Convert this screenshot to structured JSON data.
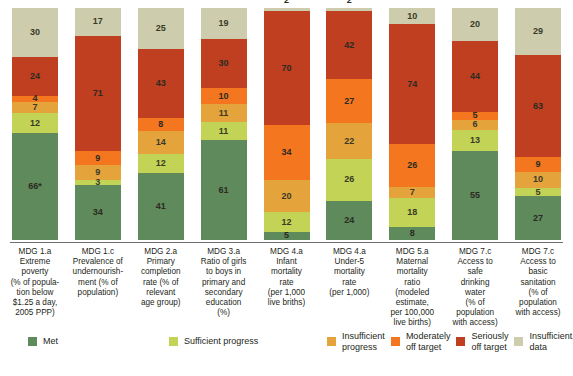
{
  "chart_data": {
    "type": "bar",
    "subtype": "stacked-100-percent",
    "title": "",
    "xlabel": "",
    "ylabel": "",
    "grid": false,
    "legend_position": "bottom",
    "categories": [
      "MDG 1.a Extreme poverty (% of population below $1.25 a day, 2005 PPP)",
      "MDG 1.c Prevalence of undernourishment (% of population)",
      "MDG 2.a Primary completion rate (% of relevant age group)",
      "MDG 3.a Ratio of girls to boys in primary and secondary education (%)",
      "MDG 4.a Infant mortality rate (per 1,000 live briths)",
      "MDG 4.a Under-5 mortality rate (per 1,000)",
      "MDG 5.a Maternal mortality ratio (modeled estimate, per 100,000 live births)",
      "MDG 7.c Access to safe drinking water (% of population with access)",
      "MDG 7.c Access to basic sanitation (% of population with access)"
    ],
    "series": [
      {
        "name": "Met",
        "color": "#5f8a5c",
        "values": [
          66,
          34,
          41,
          61,
          5,
          24,
          8,
          55,
          27
        ]
      },
      {
        "name": "Sufficient progress",
        "color": "#c3d355",
        "values": [
          12,
          3,
          12,
          11,
          12,
          26,
          18,
          13,
          5
        ]
      },
      {
        "name": "Insufficient progress",
        "color": "#e5a33c",
        "values": [
          7,
          9,
          14,
          11,
          20,
          22,
          7,
          6,
          10
        ]
      },
      {
        "name": "Moderately off target",
        "color": "#f4761f",
        "values": [
          4,
          9,
          8,
          10,
          34,
          27,
          26,
          5,
          9
        ]
      },
      {
        "name": "Seriously off target",
        "color": "#bf3f20",
        "values": [
          24,
          71,
          43,
          30,
          70,
          42,
          74,
          44,
          63
        ]
      },
      {
        "name": "Insufficient data",
        "color": "#cdcdae",
        "values": [
          30,
          17,
          25,
          19,
          2,
          2,
          10,
          20,
          29
        ]
      }
    ]
  },
  "bars": [
    {
      "category_lines": [
        "MDG 1.a",
        "Extreme",
        "poverty",
        "(% of popula-",
        "tion below",
        "$1.25 a day,",
        "2005 PPP)"
      ],
      "segments": [
        {
          "label": "30",
          "value": 30,
          "series": "Insufficient data"
        },
        {
          "label": "24",
          "value": 24,
          "series": "Seriously off target"
        },
        {
          "label": "4",
          "value": 4,
          "series": "Moderately off target"
        },
        {
          "label": "7",
          "value": 7,
          "series": "Insufficient progress"
        },
        {
          "label": "12",
          "value": 12,
          "series": "Sufficient progress"
        },
        {
          "label": "66*",
          "value": 66,
          "series": "Met"
        }
      ]
    },
    {
      "category_lines": [
        "MDG 1.c",
        "Prevalence of",
        "undernourish-",
        "ment (% of",
        "population)"
      ],
      "segments": [
        {
          "label": "17",
          "value": 17,
          "series": "Insufficient data"
        },
        {
          "label": "71",
          "value": 71,
          "series": "Seriously off target"
        },
        {
          "label": "9",
          "value": 9,
          "series": "Moderately off target"
        },
        {
          "label": "9",
          "value": 9,
          "series": "Insufficient progress"
        },
        {
          "label": "3",
          "value": 3,
          "series": "Sufficient progress"
        },
        {
          "label": "34",
          "value": 34,
          "series": "Met"
        }
      ]
    },
    {
      "category_lines": [
        "MDG 2.a",
        "Primary",
        "completion",
        "rate (% of",
        "relevant",
        "age group)"
      ],
      "segments": [
        {
          "label": "25",
          "value": 25,
          "series": "Insufficient data"
        },
        {
          "label": "43",
          "value": 43,
          "series": "Seriously off target"
        },
        {
          "label": "8",
          "value": 8,
          "series": "Moderately off target"
        },
        {
          "label": "14",
          "value": 14,
          "series": "Insufficient progress"
        },
        {
          "label": "12",
          "value": 12,
          "series": "Sufficient progress"
        },
        {
          "label": "41",
          "value": 41,
          "series": "Met"
        }
      ]
    },
    {
      "category_lines": [
        "MDG 3.a",
        "Ratio of girls",
        "to boys in",
        "primary and",
        "secondary",
        "education",
        "(%)"
      ],
      "segments": [
        {
          "label": "19",
          "value": 19,
          "series": "Insufficient data"
        },
        {
          "label": "30",
          "value": 30,
          "series": "Seriously off target"
        },
        {
          "label": "10",
          "value": 10,
          "series": "Moderately off target"
        },
        {
          "label": "11",
          "value": 11,
          "series": "Insufficient progress"
        },
        {
          "label": "11",
          "value": 11,
          "series": "Sufficient progress"
        },
        {
          "label": "61",
          "value": 61,
          "series": "Met"
        }
      ]
    },
    {
      "category_lines": [
        "MDG 4.a",
        "Infant",
        "mortality",
        "rate",
        "(per 1,000",
        "live briths)"
      ],
      "segments": [
        {
          "label": "2",
          "value": 2,
          "series": "Insufficient data",
          "label_outside": true
        },
        {
          "label": "70",
          "value": 70,
          "series": "Seriously off target"
        },
        {
          "label": "34",
          "value": 34,
          "series": "Moderately off target"
        },
        {
          "label": "20",
          "value": 20,
          "series": "Insufficient progress"
        },
        {
          "label": "12",
          "value": 12,
          "series": "Sufficient progress"
        },
        {
          "label": "5",
          "value": 5,
          "series": "Met"
        }
      ]
    },
    {
      "category_lines": [
        "MDG 4.a",
        "Under-5",
        "mortality",
        "rate",
        "(per 1,000)"
      ],
      "segments": [
        {
          "label": "2",
          "value": 2,
          "series": "Insufficient data",
          "label_outside": true
        },
        {
          "label": "42",
          "value": 42,
          "series": "Seriously off target"
        },
        {
          "label": "27",
          "value": 27,
          "series": "Moderately off target"
        },
        {
          "label": "22",
          "value": 22,
          "series": "Insufficient progress"
        },
        {
          "label": "26",
          "value": 26,
          "series": "Sufficient progress"
        },
        {
          "label": "24",
          "value": 24,
          "series": "Met"
        }
      ]
    },
    {
      "category_lines": [
        "MDG 5.a",
        "Maternal",
        "mortality",
        "ratio",
        "(modeled",
        "estimate,",
        "per 100,000",
        "live births)"
      ],
      "segments": [
        {
          "label": "10",
          "value": 10,
          "series": "Insufficient data"
        },
        {
          "label": "74",
          "value": 74,
          "series": "Seriously off target"
        },
        {
          "label": "26",
          "value": 26,
          "series": "Moderately off target"
        },
        {
          "label": "7",
          "value": 7,
          "series": "Insufficient progress"
        },
        {
          "label": "18",
          "value": 18,
          "series": "Sufficient progress"
        },
        {
          "label": "8",
          "value": 8,
          "series": "Met"
        }
      ]
    },
    {
      "category_lines": [
        "MDG 7.c",
        "Access to",
        "safe",
        "drinking",
        "water",
        "(% of",
        "population",
        "with access)"
      ],
      "segments": [
        {
          "label": "20",
          "value": 20,
          "series": "Insufficient data"
        },
        {
          "label": "44",
          "value": 44,
          "series": "Seriously off target"
        },
        {
          "label": "5",
          "value": 5,
          "series": "Moderately off target"
        },
        {
          "label": "6",
          "value": 6,
          "series": "Insufficient progress"
        },
        {
          "label": "13",
          "value": 13,
          "series": "Sufficient progress"
        },
        {
          "label": "55",
          "value": 55,
          "series": "Met"
        }
      ]
    },
    {
      "category_lines": [
        "MDG 7.c",
        "Access to",
        "basic",
        "sanitation",
        "(% of",
        "population",
        "with access)"
      ],
      "segments": [
        {
          "label": "29",
          "value": 29,
          "series": "Insufficient data"
        },
        {
          "label": "63",
          "value": 63,
          "series": "Seriously off target"
        },
        {
          "label": "9",
          "value": 9,
          "series": "Moderately off target"
        },
        {
          "label": "10",
          "value": 10,
          "series": "Insufficient progress"
        },
        {
          "label": "5",
          "value": 5,
          "series": "Sufficient progress"
        },
        {
          "label": "27",
          "value": 27,
          "series": "Met"
        }
      ]
    }
  ],
  "legend": {
    "items": [
      {
        "label": "Met",
        "color": "#5f8a5c"
      },
      {
        "label": "Sufficient progress",
        "color": "#c3d355"
      },
      {
        "label": "Insufficient progress",
        "color": "#e5a33c"
      },
      {
        "label": "Moderately off target",
        "color": "#f4761f"
      },
      {
        "label": "Seriously off target",
        "color": "#bf3f20"
      },
      {
        "label": "Insufficient data",
        "color": "#cdcdae"
      }
    ]
  },
  "colors": {
    "met": "#5f8a5c",
    "sufficient_progress": "#c3d355",
    "insufficient_progress": "#e5a33c",
    "moderately_off_target": "#f4761f",
    "seriously_off_target": "#bf3f20",
    "insufficient_data": "#cdcdae",
    "axis": "#6d6e71",
    "text": "#231f20",
    "background": "#ffffff"
  }
}
